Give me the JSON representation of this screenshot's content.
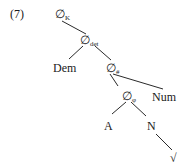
{
  "example": {
    "number": "(7)"
  },
  "tree": {
    "nodes": {
      "k": {
        "symbol": "∅",
        "sub": "K"
      },
      "det": {
        "symbol": "∅",
        "sub": "det"
      },
      "dem": {
        "label": "Dem"
      },
      "hash": {
        "symbol": "∅",
        "sub": "#"
      },
      "num": {
        "label": "Num"
      },
      "phi": {
        "symbol": "∅",
        "sub": "φ"
      },
      "a": {
        "label": "A"
      },
      "n": {
        "label": "N"
      },
      "root": {
        "label": "√"
      }
    },
    "edges": [
      [
        "k",
        "det"
      ],
      [
        "det",
        "dem"
      ],
      [
        "det",
        "hash"
      ],
      [
        "hash",
        "phi"
      ],
      [
        "hash",
        "num"
      ],
      [
        "phi",
        "a"
      ],
      [
        "phi",
        "n"
      ],
      [
        "n",
        "root"
      ]
    ]
  }
}
